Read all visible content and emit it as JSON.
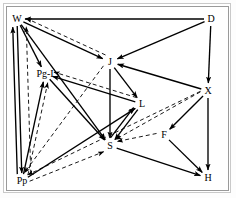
{
  "diagram": {
    "background_color": "#ffffff",
    "frame_color": "#9a9a9a",
    "solid_edge_color": "#000000",
    "dashed_edge_color": "#1a1a1a",
    "nodes": [
      {
        "id": "W",
        "label": "W",
        "x": 17,
        "y": 19
      },
      {
        "id": "D",
        "label": "D",
        "x": 211,
        "y": 19
      },
      {
        "id": "PgI",
        "label": "Pg-I",
        "x": 45,
        "y": 74
      },
      {
        "id": "J",
        "label": "J",
        "x": 110,
        "y": 62
      },
      {
        "id": "X",
        "label": "X",
        "x": 208,
        "y": 91
      },
      {
        "id": "L",
        "label": "L",
        "x": 142,
        "y": 104
      },
      {
        "id": "F",
        "label": "F",
        "x": 164,
        "y": 135
      },
      {
        "id": "S",
        "label": "S",
        "x": 110,
        "y": 146
      },
      {
        "id": "Pp",
        "label": "Pp",
        "x": 22,
        "y": 181
      },
      {
        "id": "H",
        "label": "H",
        "x": 208,
        "y": 178
      }
    ],
    "edges": [
      {
        "from": "D",
        "to": "W",
        "style": "solid"
      },
      {
        "from": "D",
        "to": "J",
        "style": "solid"
      },
      {
        "from": "D",
        "to": "X",
        "style": "solid"
      },
      {
        "from": "W",
        "to": "J",
        "style": "solid"
      },
      {
        "from": "W",
        "to": "PgI",
        "style": "solid"
      },
      {
        "from": "W",
        "to": "S",
        "style": "solid"
      },
      {
        "from": "W",
        "to": "Pp",
        "style": "solid"
      },
      {
        "from": "Pp",
        "to": "W",
        "style": "solid"
      },
      {
        "from": "Pp",
        "to": "W",
        "style": "dashed"
      },
      {
        "from": "J",
        "to": "W",
        "style": "dashed"
      },
      {
        "from": "J",
        "to": "L",
        "style": "solid"
      },
      {
        "from": "J",
        "to": "S",
        "style": "solid"
      },
      {
        "from": "J",
        "to": "Pp",
        "style": "dashed"
      },
      {
        "from": "X",
        "to": "J",
        "style": "solid"
      },
      {
        "from": "X",
        "to": "F",
        "style": "solid"
      },
      {
        "from": "X",
        "to": "H",
        "style": "solid"
      },
      {
        "from": "X",
        "to": "S",
        "style": "dashed"
      },
      {
        "from": "X",
        "to": "Pp",
        "style": "dashed"
      },
      {
        "from": "L",
        "to": "S",
        "style": "solid"
      },
      {
        "from": "L",
        "to": "PgI",
        "style": "solid"
      },
      {
        "from": "L",
        "to": "PgI",
        "style": "dashed"
      },
      {
        "from": "PgI",
        "to": "S",
        "style": "solid"
      },
      {
        "from": "Pp",
        "to": "PgI",
        "style": "solid"
      },
      {
        "from": "Pp",
        "to": "PgI",
        "style": "dashed"
      },
      {
        "from": "Pp",
        "to": "L",
        "style": "solid"
      },
      {
        "from": "Pp",
        "to": "S",
        "style": "dashed"
      },
      {
        "from": "F",
        "to": "S",
        "style": "dashed"
      },
      {
        "from": "F",
        "to": "H",
        "style": "solid"
      },
      {
        "from": "S",
        "to": "H",
        "style": "solid"
      },
      {
        "from": "S",
        "to": "L",
        "style": "solid"
      }
    ]
  }
}
